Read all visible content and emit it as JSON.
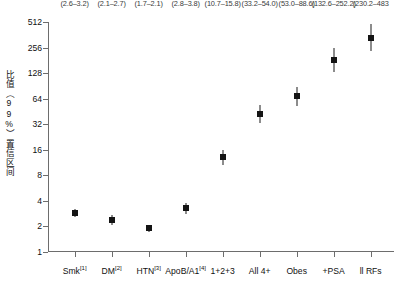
{
  "chart_data": {
    "type": "scatter",
    "title": "",
    "xlabel": "",
    "ylabel": "比值（99%）置信区间",
    "yscale": "log2",
    "ylim": [
      1,
      512
    ],
    "yticks": [
      1,
      2,
      4,
      8,
      16,
      32,
      64,
      128,
      256,
      512
    ],
    "ytick_labels": [
      "1",
      "2",
      "4",
      "8",
      "16",
      "32",
      "64",
      "128",
      "256",
      "512"
    ],
    "grid": false,
    "legend": null,
    "categories": [
      "Smk",
      "DM",
      "HTN",
      "ApoB/A1",
      "1+2+3",
      "All 4+",
      "Obes",
      "+PSA",
      "ll RFs"
    ],
    "category_superscripts": [
      "1",
      "2",
      "3",
      "4",
      "",
      "",
      "",
      "",
      ""
    ],
    "values": [
      2.9,
      2.4,
      1.9,
      3.3,
      13.0,
      42.3,
      68.5,
      182.9,
      333.7
    ],
    "ci_low": [
      2.6,
      2.1,
      1.7,
      2.8,
      10.7,
      33.2,
      53.0,
      132.6,
      230.2
    ],
    "ci_high": [
      3.2,
      2.7,
      2.1,
      3.8,
      15.8,
      54.0,
      88.6,
      252.2,
      483.0
    ],
    "ci_labels": [
      "(2.6–3.2)",
      "(2.1–2.7)",
      "(1.7–2.1)",
      "(2.8–3.8)",
      "(10.7–15.8)",
      "(33.2–54.0)",
      "(53.0–88.6)",
      "(132.6–252.2)",
      "(230.2–483"
    ],
    "marker": "square",
    "marker_color": "#141414",
    "axis_color": "#6d6d6d"
  }
}
